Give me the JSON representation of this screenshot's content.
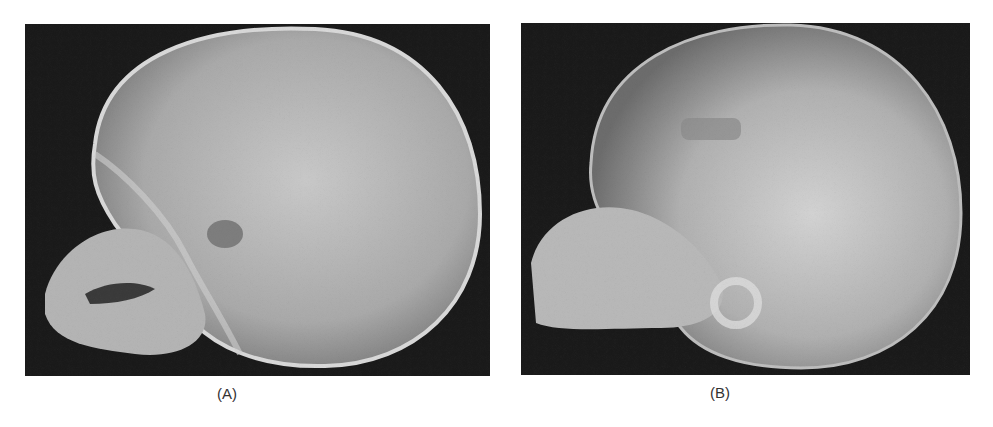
{
  "figure": {
    "panels": [
      {
        "id": "A",
        "label": "(A)",
        "description": "Lateral skull radiograph of an infant"
      },
      {
        "id": "B",
        "label": "(B)",
        "description": "Lateral skull radiograph of an infant"
      }
    ],
    "colors": {
      "background": "#ffffff",
      "film_dark": "#1a1a1a",
      "bone_light": "#cfcfcf"
    }
  }
}
